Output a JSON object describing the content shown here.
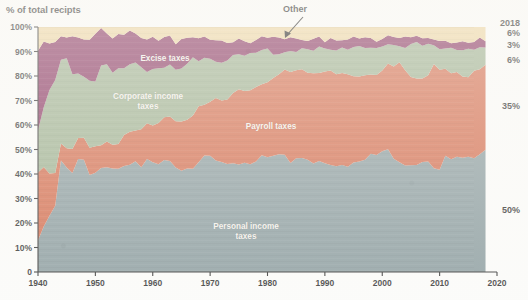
{
  "chart_data": {
    "type": "area",
    "stacked": true,
    "title": "% of total recipts",
    "xlabel": "",
    "ylabel": "% of total recipts",
    "xlim": [
      1940,
      2020
    ],
    "ylim": [
      0,
      100
    ],
    "grid": false,
    "legend": "inline-labels",
    "x_ticks": [
      "1940",
      "1950",
      "1960",
      "1970",
      "1980",
      "1990",
      "2000",
      "2010",
      "2020"
    ],
    "y_ticks": [
      "0",
      "10%",
      "20%",
      "30%",
      "40%",
      "50%",
      "60%",
      "70%",
      "80%",
      "90%",
      "100%"
    ],
    "annotations": [
      {
        "text": "Other",
        "target_series": "Other",
        "arrow": true
      }
    ],
    "end_year": "2018",
    "x": [
      1940,
      1941,
      1942,
      1943,
      1944,
      1945,
      1946,
      1947,
      1948,
      1949,
      1950,
      1951,
      1952,
      1953,
      1954,
      1955,
      1956,
      1957,
      1958,
      1959,
      1960,
      1961,
      1962,
      1963,
      1964,
      1965,
      1966,
      1967,
      1968,
      1969,
      1970,
      1971,
      1972,
      1973,
      1974,
      1975,
      1976,
      1977,
      1978,
      1979,
      1980,
      1981,
      1982,
      1983,
      1984,
      1985,
      1986,
      1987,
      1988,
      1989,
      1990,
      1991,
      1992,
      1993,
      1994,
      1995,
      1996,
      1997,
      1998,
      1999,
      2000,
      2001,
      2002,
      2003,
      2004,
      2005,
      2006,
      2007,
      2008,
      2009,
      2010,
      2011,
      2012,
      2013,
      2014,
      2015,
      2016,
      2017,
      2018
    ],
    "series": [
      {
        "name": "Personal income taxes",
        "color": "#7f9295",
        "label": "Personal income taxes",
        "end_value": "50%",
        "values": [
          13,
          18,
          23,
          27,
          45,
          43,
          41,
          46,
          46,
          40,
          40,
          42,
          43,
          42,
          42,
          44,
          44,
          45,
          43,
          46,
          44,
          44,
          46,
          45,
          43,
          42,
          42,
          42,
          45,
          47,
          47,
          46,
          45,
          44,
          45,
          44,
          44,
          44,
          45,
          47,
          47,
          48,
          48,
          48,
          45,
          46,
          46,
          46,
          44,
          45,
          45,
          44,
          43,
          44,
          43,
          44,
          45,
          46,
          48,
          48,
          50,
          50,
          46,
          45,
          43,
          43,
          44,
          45,
          45,
          43,
          42,
          47,
          46,
          47,
          46,
          47,
          47,
          48,
          50
        ]
      },
      {
        "name": "Payroll taxes",
        "color": "#cf5e3c",
        "label": "Payroll taxes",
        "end_value": "35%",
        "values": [
          27,
          25,
          17,
          13,
          8,
          8,
          9,
          9,
          9,
          10,
          11,
          10,
          10,
          10,
          11,
          12,
          13,
          13,
          15,
          14,
          16,
          17,
          17,
          19,
          19,
          19,
          20,
          22,
          22,
          21,
          23,
          25,
          25,
          27,
          28,
          30,
          30,
          30,
          30,
          30,
          31,
          31,
          33,
          35,
          36,
          36,
          37,
          35,
          37,
          37,
          37,
          38,
          38,
          37,
          37,
          36,
          35,
          34,
          33,
          33,
          32,
          35,
          38,
          40,
          39,
          37,
          35,
          34,
          36,
          42,
          40,
          36,
          35,
          34,
          34,
          33,
          35,
          35,
          35
        ]
      },
      {
        "name": "Corporate income taxes",
        "color": "#93a884",
        "label": "Corporate income taxes",
        "end_value": "6%",
        "values": [
          18,
          24,
          34,
          39,
          34,
          36,
          31,
          26,
          24,
          28,
          27,
          32,
          32,
          30,
          30,
          27,
          28,
          27,
          25,
          22,
          23,
          22,
          21,
          21,
          20,
          22,
          23,
          23,
          19,
          20,
          17,
          15,
          16,
          15,
          15,
          15,
          14,
          15,
          15,
          14,
          13,
          10,
          8,
          6,
          9,
          8,
          8,
          10,
          10,
          10,
          9,
          9,
          9,
          10,
          11,
          12,
          12,
          12,
          11,
          10,
          10,
          8,
          8,
          7,
          10,
          13,
          15,
          14,
          12,
          7,
          9,
          8,
          10,
          10,
          11,
          11,
          9,
          9,
          6
        ]
      },
      {
        "name": "Excise taxes",
        "color": "#7d1f50",
        "label": "Excise taxes",
        "end_value": "3%",
        "values": [
          32,
          27,
          20,
          15,
          9,
          9,
          15,
          14,
          16,
          17,
          19,
          16,
          13,
          13,
          14,
          14,
          13,
          12,
          13,
          13,
          13,
          12,
          12,
          11,
          11,
          12,
          10,
          9,
          10,
          8,
          8,
          9,
          8,
          7,
          6,
          6,
          6,
          5,
          5,
          5,
          5,
          7,
          6,
          6,
          6,
          5,
          4,
          4,
          4,
          4,
          3,
          4,
          4,
          4,
          4,
          4,
          4,
          4,
          3,
          3,
          3,
          3,
          4,
          4,
          4,
          3,
          3,
          2,
          2,
          3,
          3,
          3,
          3,
          3,
          3,
          3,
          3,
          3,
          3
        ]
      },
      {
        "name": "Other",
        "color": "#ebd199",
        "label": "Other",
        "end_value": "6%",
        "values": [
          10,
          6,
          6,
          6,
          4,
          4,
          4,
          5,
          5,
          5,
          3,
          0,
          2,
          5,
          3,
          3,
          2,
          3,
          4,
          5,
          4,
          5,
          4,
          4,
          7,
          5,
          5,
          4,
          4,
          4,
          5,
          5,
          6,
          7,
          6,
          5,
          6,
          6,
          5,
          4,
          4,
          4,
          5,
          5,
          4,
          5,
          5,
          5,
          6,
          4,
          6,
          5,
          6,
          5,
          5,
          5,
          4,
          4,
          5,
          6,
          5,
          4,
          4,
          4,
          4,
          4,
          3,
          5,
          5,
          5,
          6,
          6,
          6,
          6,
          6,
          6,
          6,
          5,
          6
        ]
      }
    ]
  }
}
